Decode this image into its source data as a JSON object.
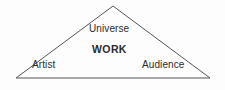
{
  "diagram": {
    "type": "triangle-diagram",
    "background_color": "#fdfdfd",
    "stroke_color": "#55555a",
    "text_color": "#2b2b2b",
    "canvas": {
      "width": 225,
      "height": 90
    },
    "shape": {
      "name": "triangle",
      "points": "113,6 210,78 16,78",
      "apex": {
        "x": 113,
        "y": 6
      },
      "bottom_left": {
        "x": 16,
        "y": 78
      },
      "bottom_right": {
        "x": 210,
        "y": 78
      },
      "stroke_width": 1
    },
    "labels": {
      "universe": "Universe",
      "work": "WORK",
      "artist": "Artist",
      "audience": "Audience"
    }
  }
}
